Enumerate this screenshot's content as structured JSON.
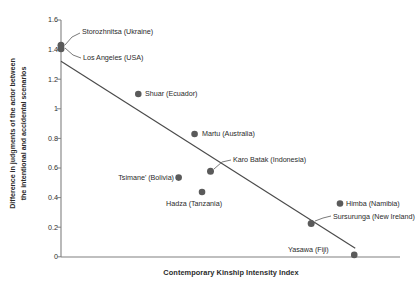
{
  "chart_data": {
    "type": "scatter",
    "title": "",
    "xlabel": "Contemporary Kinship Intensity Index",
    "ylabel_line1": "Difference in judgments of the actor between",
    "ylabel_line2": "the intentional and accidental scenarios",
    "ylim": [
      0,
      1.6
    ],
    "yticks": [
      "0",
      "0.2",
      "0.4",
      "0.6",
      "0.8",
      "1",
      "1.2",
      "1.4",
      "1.6"
    ],
    "ytick_values": [
      0,
      0.2,
      0.4,
      0.6,
      0.8,
      1,
      1.2,
      1.4,
      1.6
    ],
    "xlim": [
      0,
      1
    ],
    "xticks": [],
    "grid": false,
    "legend": null,
    "marker_color": "#5a5a5a",
    "line_color": "#4a4a4a",
    "axis_color": "#808080",
    "points": [
      {
        "label": "Storozhnitsa (Ukraine)",
        "x": 0.0,
        "y": 1.43,
        "label_pos": "leader-upper-right"
      },
      {
        "label": "Los Angeles (USA)",
        "x": 0.0,
        "y": 1.405,
        "label_pos": "leader-lower-right"
      },
      {
        "label": "Shuar (Ecuador)",
        "x": 0.228,
        "y": 1.1,
        "label_pos": "right"
      },
      {
        "label": "Martu (Australia)",
        "x": 0.394,
        "y": 0.83,
        "label_pos": "right"
      },
      {
        "label": "Karo Batak (Indonesia)",
        "x": 0.441,
        "y": 0.578,
        "label_pos": "leader-upper-right"
      },
      {
        "label": "Tsimane' (Bolivia)",
        "x": 0.347,
        "y": 0.535,
        "label_pos": "left"
      },
      {
        "label": "Hadza (Tanzania)",
        "x": 0.416,
        "y": 0.438,
        "label_pos": "below"
      },
      {
        "label": "Himba (Namibia)",
        "x": 0.823,
        "y": 0.36,
        "label_pos": "right"
      },
      {
        "label": "Sursurunga (New Ireland)",
        "x": 0.738,
        "y": 0.225,
        "label_pos": "right"
      },
      {
        "label": "Yasawa (Fiji)",
        "x": 0.865,
        "y": 0.013,
        "label_pos": "left"
      }
    ],
    "trendline": {
      "x0": 0.0,
      "y0": 1.322,
      "x1": 0.868,
      "y1": 0.058
    }
  }
}
